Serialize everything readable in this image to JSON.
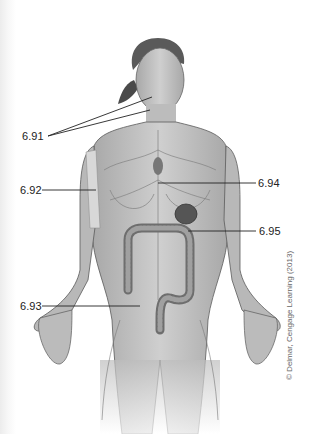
{
  "figure": {
    "labels": [
      {
        "id": "6.91",
        "text": "6.91",
        "target": "neck / lymph nodes (two leader lines)"
      },
      {
        "id": "6.92",
        "text": "6.92",
        "target": "upper arm bone"
      },
      {
        "id": "6.93",
        "text": "6.93",
        "target": "lower abdomen / large intestine region"
      },
      {
        "id": "6.94",
        "text": "6.94",
        "target": "thoracic duct / chest"
      },
      {
        "id": "6.95",
        "text": "6.95",
        "target": "spleen"
      }
    ],
    "copyright": "© Delmar, Cengage Learning (2013)"
  },
  "colors": {
    "skin": "#bdbdbd",
    "outline": "#555555",
    "organ": "#8a8a8a",
    "leader_line": "#222222",
    "background": "#ffffff"
  }
}
